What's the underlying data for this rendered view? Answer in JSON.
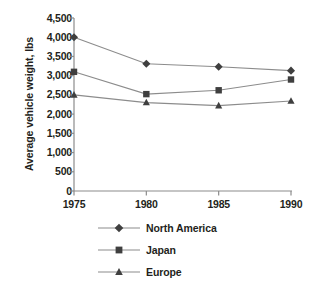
{
  "chart_data": {
    "type": "line",
    "title": "",
    "xlabel": "",
    "ylabel": "Average vehicle weight, lbs",
    "categories": [
      "1975",
      "1980",
      "1985",
      "1990"
    ],
    "x": [
      1975,
      1980,
      1985,
      1990
    ],
    "xlim": [
      1975,
      1990
    ],
    "ylim": [
      0,
      4500
    ],
    "yticks": [
      0,
      500,
      1000,
      1500,
      2000,
      2500,
      3000,
      3500,
      4000,
      4500
    ],
    "ytick_labels": [
      "0",
      "500",
      "1,000",
      "1,500",
      "2,000",
      "2,500",
      "3,000",
      "3,500",
      "4,000",
      "4,500"
    ],
    "grid": false,
    "legend_position": "bottom-center",
    "series": [
      {
        "name": "North America",
        "marker": "diamond",
        "color": "#3f3f3f",
        "values": [
          4000,
          3310,
          3230,
          3130
        ]
      },
      {
        "name": "Japan",
        "marker": "square",
        "color": "#3f3f3f",
        "values": [
          3100,
          2520,
          2620,
          2900
        ]
      },
      {
        "name": "Europe",
        "marker": "triangle",
        "color": "#3f3f3f",
        "values": [
          2500,
          2300,
          2220,
          2340
        ]
      }
    ]
  },
  "axis": {
    "line_color": "#8c8c8c",
    "text_color": "#231f20"
  }
}
